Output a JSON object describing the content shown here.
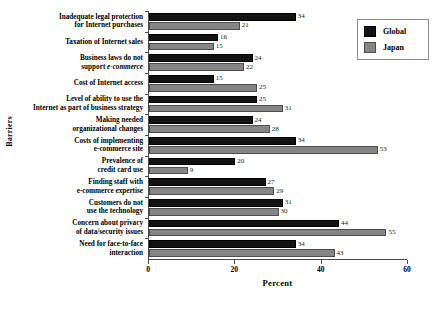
{
  "chart_data": {
    "type": "bar",
    "orientation": "horizontal",
    "title": "",
    "xlabel": "Percent",
    "ylabel": "Barriers",
    "xlim": [
      0,
      60
    ],
    "xticks": [
      0,
      20,
      40,
      60
    ],
    "grid": false,
    "legend_position": "top-right",
    "categories": [
      "Inadequate legal protection for Internet purchases",
      "Taxation of Internet sales",
      "Business laws do not support e-commerce",
      "Cost of Internet access",
      "Level of ability to use the Internet as part of business strategy",
      "Making needed organizational changes",
      "Costs of implementing e-commerce site",
      "Prevalence of credit card use",
      "Finding staff with e-commerce expertise",
      "Customers do not use the technology",
      "Concern about privacy of data/security issues",
      "Need for face-to-face interaction"
    ],
    "category_lines": [
      [
        "Inadequate legal protection",
        "for Internet purchases"
      ],
      [
        "Taxation of Internet sales"
      ],
      [
        "Business laws do not",
        "support e-commerce"
      ],
      [
        "Cost of Internet access"
      ],
      [
        "Level of ability to use the",
        "Internet as part of business strategy"
      ],
      [
        "Making needed",
        "organizational changes"
      ],
      [
        "Costs of implementing",
        "e-commerce site"
      ],
      [
        "Prevalence of",
        "credit card use"
      ],
      [
        "Finding staff with",
        "e-commerce expertise"
      ],
      [
        "Customers do not",
        "use the technology"
      ],
      [
        "Concern about privacy",
        "of data/security issues"
      ],
      [
        "Need for face-to-face",
        "interaction"
      ]
    ],
    "series": [
      {
        "name": "Global",
        "color": "#121212",
        "values": [
          34,
          16,
          24,
          15,
          25,
          24,
          34,
          20,
          27,
          31,
          44,
          34
        ]
      },
      {
        "name": "Japan",
        "color": "#858585",
        "values": [
          21,
          15,
          22,
          25,
          31,
          28,
          53,
          9,
          29,
          30,
          55,
          43
        ]
      }
    ]
  },
  "legend": {
    "items": [
      {
        "label": "Global",
        "color": "#121212"
      },
      {
        "label": "Japan",
        "color": "#858585"
      }
    ]
  },
  "axes": {
    "x_title": "Percent",
    "y_title": "Barriers",
    "x_tick_labels": [
      "0",
      "20",
      "40",
      "60"
    ]
  }
}
